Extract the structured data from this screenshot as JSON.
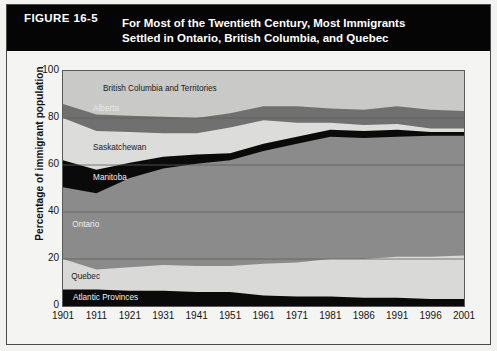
{
  "figure": {
    "number": "FIGURE 16-5",
    "title_line1": "For Most of the Twentieth Century, Most Immigrants",
    "title_line2": "Settled in Ontario, British Columbia, and Quebec"
  },
  "chart_data": {
    "type": "area",
    "title": "For Most of the Twentieth Century, Most Immigrants Settled in Ontario, British Columbia, and Quebec",
    "xlabel": "",
    "ylabel": "Percentage of immigrant population",
    "ylim": [
      0,
      100
    ],
    "yticks": [
      0,
      20,
      40,
      60,
      80,
      100
    ],
    "grid": true,
    "legend": "inline-labels",
    "stacked": true,
    "categories": [
      "1901",
      "1911",
      "1921",
      "1931",
      "1941",
      "1951",
      "1961",
      "1971",
      "1981",
      "1986",
      "1991",
      "1996",
      "2001"
    ],
    "series": [
      {
        "name": "Atlantic Provinces",
        "color": "#0a0a0a",
        "values": [
          7.0,
          7.0,
          6.5,
          6.5,
          6.0,
          6.0,
          4.5,
          4.0,
          4.0,
          3.5,
          3.5,
          3.0,
          3.0
        ]
      },
      {
        "name": "Quebec",
        "color": "#d9d9d7",
        "values": [
          13.0,
          8.5,
          10.0,
          11.0,
          11.0,
          11.0,
          13.5,
          14.5,
          16.0,
          16.5,
          17.5,
          18.0,
          18.5
        ]
      },
      {
        "name": "Ontario",
        "color": "#8b8b8b",
        "values": [
          30.5,
          32.5,
          38.0,
          41.0,
          43.5,
          45.0,
          48.0,
          50.5,
          52.0,
          51.5,
          51.0,
          51.5,
          51.0
        ]
      },
      {
        "name": "Manitoba",
        "color": "#0a0a0a",
        "values": [
          11.5,
          10.0,
          6.5,
          5.0,
          4.0,
          3.0,
          3.0,
          3.0,
          3.0,
          3.0,
          3.0,
          1.5,
          1.5
        ]
      },
      {
        "name": "Saskatchewan",
        "color": "#dcdcda",
        "values": [
          18.0,
          16.5,
          13.0,
          10.0,
          9.0,
          11.0,
          10.0,
          6.0,
          3.0,
          2.5,
          2.5,
          1.5,
          1.5
        ]
      },
      {
        "name": "Alberta",
        "color": "#707070",
        "values": [
          6.0,
          7.0,
          7.0,
          7.0,
          6.5,
          6.0,
          6.0,
          7.0,
          6.0,
          6.5,
          7.5,
          8.0,
          7.5
        ]
      },
      {
        "name": "British Columbia and Territories",
        "color": "#c9c9c7",
        "values": [
          14.0,
          18.5,
          19.0,
          19.5,
          20.0,
          18.0,
          15.0,
          15.0,
          16.0,
          16.5,
          15.5,
          16.5,
          17.0
        ]
      }
    ],
    "cumulative_tops": {
      "Atlantic Provinces": [
        7.0,
        7.0,
        6.5,
        6.5,
        6.0,
        6.0,
        4.5,
        4.0,
        4.0,
        3.5,
        3.5,
        3.0,
        3.0
      ],
      "Quebec": [
        20.0,
        15.5,
        16.5,
        17.5,
        17.0,
        17.0,
        18.0,
        18.5,
        20.0,
        20.0,
        21.0,
        21.0,
        21.5
      ],
      "Ontario": [
        50.5,
        48.0,
        54.5,
        58.5,
        60.5,
        62.0,
        66.0,
        69.0,
        72.0,
        71.5,
        72.0,
        72.5,
        72.5
      ],
      "Manitoba": [
        62.0,
        58.0,
        61.0,
        63.5,
        64.5,
        65.0,
        69.0,
        72.0,
        75.0,
        74.5,
        75.0,
        74.0,
        74.0
      ],
      "Saskatchewan": [
        80.0,
        74.5,
        74.0,
        73.5,
        73.5,
        76.0,
        79.0,
        78.0,
        78.0,
        77.0,
        77.5,
        75.5,
        75.5
      ],
      "Alberta": [
        86.0,
        81.5,
        81.0,
        80.5,
        80.0,
        82.0,
        85.0,
        85.0,
        84.0,
        83.5,
        85.0,
        83.5,
        83.0
      ],
      "British Columbia and Territories": [
        100,
        100,
        100,
        100,
        100,
        100,
        100,
        100,
        100,
        100,
        100,
        100,
        100
      ]
    },
    "band_labels": [
      {
        "text": "British Columbia and Territories",
        "x_year_index": 1.2,
        "y_value": 91.5,
        "color": "#1a1a1a"
      },
      {
        "text": "Alberta",
        "x_year_index": 0.9,
        "y_value": 83.0,
        "color": "#e8e8e8"
      },
      {
        "text": "Saskatchewan",
        "x_year_index": 0.9,
        "y_value": 66.5,
        "color": "#1a1a1a"
      },
      {
        "text": "Manitoba",
        "x_year_index": 0.9,
        "y_value": 53.5,
        "color": "#f0f0f0"
      },
      {
        "text": "Ontario",
        "x_year_index": 0.28,
        "y_value": 33.5,
        "color": "#f0f0f0"
      },
      {
        "text": "Quebec",
        "x_year_index": 0.25,
        "y_value": 11.5,
        "color": "#1a1a1a"
      },
      {
        "text": "Atlantic Provinces",
        "x_year_index": 0.3,
        "y_value": 2.6,
        "color": "#f0f0f0"
      }
    ]
  }
}
